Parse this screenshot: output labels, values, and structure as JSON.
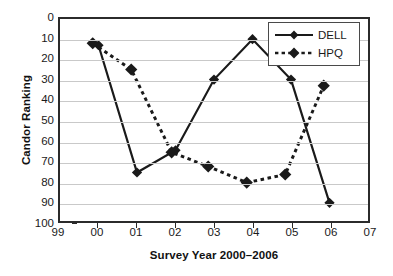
{
  "chart_data": {
    "type": "line",
    "title": "",
    "xlabel": "Survey Year 2000–2006",
    "ylabel": "Candor Ranking",
    "x": [
      2000,
      2001,
      2002,
      2003,
      2004,
      2005,
      2006
    ],
    "xtick_labels": [
      "99",
      "00",
      "01",
      "02",
      "03",
      "04",
      "05",
      "06",
      "07"
    ],
    "xtick_values": [
      1999,
      2000,
      2001,
      2002,
      2003,
      2004,
      2005,
      2006,
      2007
    ],
    "xlim": [
      1999,
      2007
    ],
    "ytick_labels": [
      "0",
      "10",
      "20",
      "30",
      "40",
      "50",
      "60",
      "70",
      "80",
      "90",
      "100"
    ],
    "ytick_values": [
      0,
      10,
      20,
      30,
      40,
      50,
      60,
      70,
      80,
      90,
      100
    ],
    "ylim": [
      0,
      100
    ],
    "y_inverted": true,
    "grid": "horizontal",
    "legend_position": "top-right",
    "series": [
      {
        "name": "DELL",
        "line_style": "solid",
        "marker": "diamond",
        "color": "#1a1a1a",
        "x": [
          2000,
          2001,
          2002,
          2003,
          2004,
          2005,
          2006
        ],
        "values": [
          13,
          76,
          65,
          30,
          10,
          30,
          91
        ]
      },
      {
        "name": "HPQ",
        "line_style": "dotted",
        "marker": "diamond",
        "color": "#1a1a1a",
        "x": [
          1999.85,
          2000.85,
          2001.9,
          2002.85,
          2003.85,
          2004.85,
          2005.85
        ],
        "values": [
          12,
          25,
          66,
          73,
          81,
          77,
          33
        ]
      }
    ]
  },
  "legend": {
    "entries": [
      {
        "label": "DELL"
      },
      {
        "label": "HPQ"
      }
    ]
  }
}
